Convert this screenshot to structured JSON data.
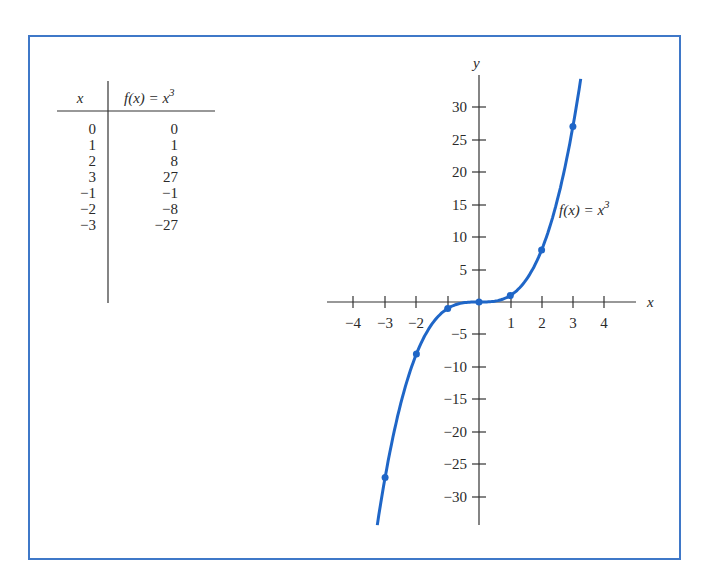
{
  "table": {
    "headers": {
      "x": "x",
      "fx_prefix": "f(x) = x",
      "fx_exp": "3"
    },
    "rows": [
      {
        "x": "0",
        "fx": "0"
      },
      {
        "x": "1",
        "fx": "1"
      },
      {
        "x": "2",
        "fx": "8"
      },
      {
        "x": "3",
        "fx": "27"
      },
      {
        "x": "−1",
        "fx": "−1"
      },
      {
        "x": "−2",
        "fx": "−8"
      },
      {
        "x": "−3",
        "fx": "−27"
      }
    ]
  },
  "graph": {
    "x_axis_label": "x",
    "y_axis_label": "y",
    "curve_label_prefix": "f(x) = x",
    "curve_label_exp": "3",
    "x_ticks_neg": [
      "−4",
      "−3",
      "−2"
    ],
    "x_ticks_pos": [
      "1",
      "2",
      "3",
      "4"
    ],
    "y_ticks_pos": [
      "30",
      "25",
      "20",
      "15",
      "10",
      "5"
    ],
    "y_ticks_neg": [
      "−5",
      "−10",
      "−15",
      "−20",
      "−25",
      "−30"
    ]
  },
  "colors": {
    "frame": "#3f78c8",
    "curve": "#1f66c7",
    "axis": "#333333"
  },
  "chart_data": {
    "type": "line",
    "title": "",
    "xlabel": "x",
    "ylabel": "y",
    "series": [
      {
        "name": "f(x) = x^3",
        "x": [
          -3,
          -2,
          -1,
          0,
          1,
          2,
          3
        ],
        "values": [
          -27,
          -8,
          -1,
          0,
          1,
          8,
          27
        ]
      }
    ],
    "x_ticks": [
      -4,
      -3,
      -2,
      -1,
      0,
      1,
      2,
      3,
      4
    ],
    "y_ticks": [
      -30,
      -25,
      -20,
      -15,
      -10,
      -5,
      0,
      5,
      10,
      15,
      20,
      25,
      30
    ],
    "xlim": [
      -5,
      5
    ],
    "ylim": [
      -35,
      35
    ],
    "grid": false,
    "legend": "none",
    "annotations": [
      "f(x) = x^3"
    ],
    "table": {
      "columns": [
        "x",
        "f(x) = x^3"
      ],
      "rows": [
        [
          0,
          0
        ],
        [
          1,
          1
        ],
        [
          2,
          8
        ],
        [
          3,
          27
        ],
        [
          -1,
          -1
        ],
        [
          -2,
          -8
        ],
        [
          -3,
          -27
        ]
      ]
    }
  }
}
